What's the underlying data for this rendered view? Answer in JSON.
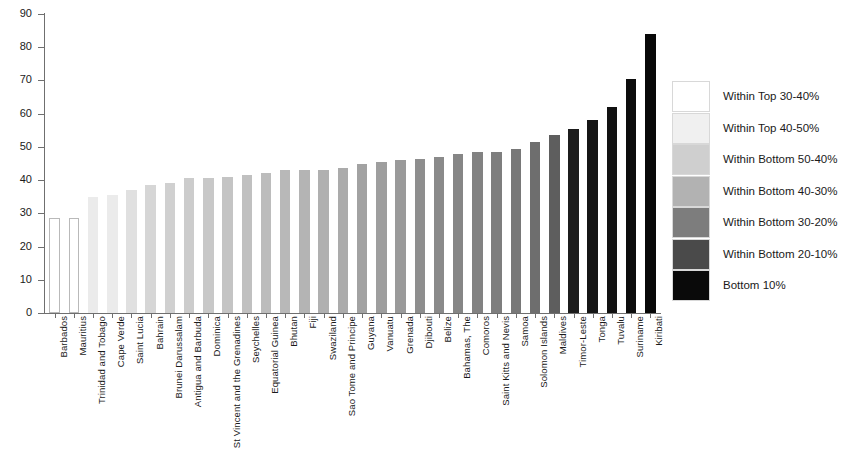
{
  "chart_data": {
    "type": "bar",
    "title": "",
    "xlabel": "",
    "ylabel": "",
    "ylim": [
      0,
      90
    ],
    "ytick_step": 10,
    "yticks": [
      0,
      10,
      20,
      30,
      40,
      50,
      60,
      70,
      80,
      90
    ],
    "grid": false,
    "legend_position": "right",
    "categories": [
      "Barbados",
      "Mauritius",
      "Trinidad and Tobago",
      "Cape Verde",
      "Saint Lucia",
      "Bahrain",
      "Brunei Darussalam",
      "Antigua and Barbuda",
      "Dominica",
      "St Vincent and the Grenadines",
      "Seychelles",
      "Equatorial Guinea",
      "Bhutan",
      "Fiji",
      "Swaziland",
      "Sao Tome and Principe",
      "Guyana",
      "Vanuatu",
      "Grenada",
      "Djibouti",
      "Belize",
      "Bahamas, The",
      "Comoros",
      "Saint Kitts and Nevis",
      "Samoa",
      "Solomon Islands",
      "Maldives",
      "Timor-Leste",
      "Tonga",
      "Tuvalu",
      "Suriname",
      "Kiribati"
    ],
    "values": [
      28.5,
      28.5,
      35.0,
      35.5,
      37.0,
      38.5,
      39.0,
      40.5,
      40.5,
      41.0,
      41.5,
      42.0,
      43.0,
      43.0,
      43.0,
      43.5,
      45.0,
      45.5,
      46.0,
      46.5,
      47.0,
      48.0,
      48.5,
      48.5,
      49.5,
      51.5,
      53.5,
      55.5,
      58.0,
      62.0,
      70.5,
      84.0
    ],
    "bar_colors": [
      "#ffffff",
      "#ffffff",
      "#ebebeb",
      "#ebebeb",
      "#e0e0e0",
      "#d6d6d6",
      "#d0d0d0",
      "#cccccc",
      "#c8c8c8",
      "#c4c4c4",
      "#c0c0c0",
      "#bcbcbc",
      "#b8b8b8",
      "#b4b4b4",
      "#b0b0b0",
      "#ababab",
      "#a2a2a2",
      "#9e9e9e",
      "#9a9a9a",
      "#8e8e8e",
      "#8a8a8a",
      "#868686",
      "#828282",
      "#7e7e7e",
      "#787878",
      "#6e6e6e",
      "#5e5e5e",
      "#1c1c1c",
      "#151515",
      "#111111",
      "#0d0d0d",
      "#080808"
    ],
    "series_note": "Single series, sorted ascending"
  },
  "legend": {
    "items": [
      {
        "label": "Within Top 30-40%",
        "color": "#ffffff"
      },
      {
        "label": "Within Top 40-50%",
        "color": "#f0f0f0"
      },
      {
        "label": "Within Bottom 50-40%",
        "color": "#cfcfcf"
      },
      {
        "label": "Within Bottom 40-30%",
        "color": "#b2b2b2"
      },
      {
        "label": "Within Bottom 30-20%",
        "color": "#7d7d7d"
      },
      {
        "label": "Within Bottom 20-10%",
        "color": "#4a4a4a"
      },
      {
        "label": "Bottom 10%",
        "color": "#0a0a0a"
      }
    ]
  },
  "axis": {
    "y_tick_labels": [
      "90",
      "80",
      "70",
      "60",
      "50",
      "40",
      "30",
      "20",
      "10",
      "0"
    ]
  }
}
